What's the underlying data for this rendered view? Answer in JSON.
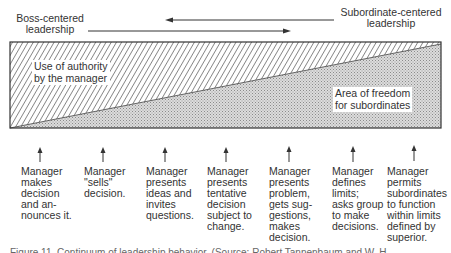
{
  "header": {
    "left_label_line1": "Boss-centered",
    "left_label_line2": "leadership",
    "right_label_line1": "Subordinate-centered",
    "right_label_line2": "leadership"
  },
  "diagram": {
    "upper_region_label_line1": "Use of authority",
    "upper_region_label_line2": "by the manager",
    "lower_region_label_line1": "Area of freedom",
    "lower_region_label_line2": "for subordinates",
    "upper_region_fill": "diagonal-hatch",
    "lower_region_fill": "stipple-gray",
    "line_color": "#333333"
  },
  "behaviors": [
    {
      "text": "Manager\nmakes\ndecision\nand an-\nnounces it."
    },
    {
      "text": "Manager\n\"sells\"\ndecision."
    },
    {
      "text": "Manager\npresents\nideas and\ninvites\nquestions."
    },
    {
      "text": "Manager\npresents\ntentative\ndecision\nsubject to\nchange."
    },
    {
      "text": "Manager\npresents\nproblem,\ngets sug-\ngestions,\nmakes\ndecision."
    },
    {
      "text": "Manager\ndefines\nlimits;\nasks group\nto make\ndecisions."
    },
    {
      "text": "Manager\npermits\nsubordinates\nto function\nwithin limits\ndefined by\nsuperior."
    }
  ],
  "caption": {
    "text": "Figure 11. Continuum of leadership behavior. (Source: Robert Tannenbaum and W. H."
  }
}
